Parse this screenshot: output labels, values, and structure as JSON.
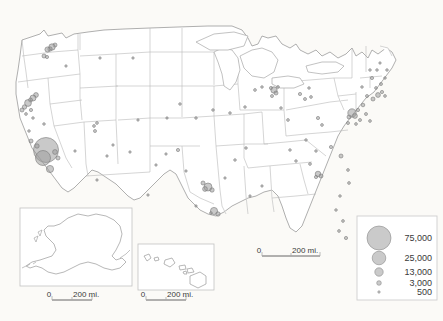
{
  "map": {
    "title": "United States proportional symbol map",
    "background_color": "#fbfaf7",
    "state_fill": "#ffffff",
    "state_stroke": "#b9b9b9",
    "bubble_fill": "#9d9d9d",
    "bubble_stroke": "#7a7a7a"
  },
  "legend": {
    "name": "proportional-symbol-legend",
    "entries": [
      {
        "value": "75,000",
        "radius": 12.0
      },
      {
        "value": "25,000",
        "radius": 6.8
      },
      {
        "value": "13,000",
        "radius": 4.2
      },
      {
        "value": "3,000",
        "radius": 2.3
      },
      {
        "value": "500",
        "radius": 1.2
      }
    ]
  },
  "scale_bars": [
    {
      "name": "main-scale-bar",
      "zero": "0",
      "distance": "200 mi."
    },
    {
      "name": "alaska-scale-bar",
      "zero": "0",
      "distance": "200 mi."
    },
    {
      "name": "hawaii-scale-bar",
      "zero": "0",
      "distance": "200 mi."
    }
  ],
  "insets": [
    {
      "name": "alaska-inset",
      "label": ""
    },
    {
      "name": "hawaii-inset",
      "label": ""
    }
  ],
  "chart_data": {
    "type": "scatter",
    "xlabel": "",
    "ylabel": "",
    "symbol_scale": "area proportional to value",
    "legend_values": [
      75000,
      25000,
      13000,
      3000,
      500
    ],
    "points": [
      {
        "x": 55.0,
        "y": 45.0,
        "r": 2.0
      },
      {
        "x": 52.0,
        "y": 47.0,
        "r": 3.2
      },
      {
        "x": 50.0,
        "y": 49.0,
        "r": 2.2
      },
      {
        "x": 47.5,
        "y": 49.5,
        "r": 2.6
      },
      {
        "x": 44.0,
        "y": 56.0,
        "r": 2.0
      },
      {
        "x": 47.0,
        "y": 57.0,
        "r": 1.6
      },
      {
        "x": 66.0,
        "y": 66.0,
        "r": 1.2
      },
      {
        "x": 100.0,
        "y": 58.0,
        "r": 1.2
      },
      {
        "x": 133.0,
        "y": 58.0,
        "r": 1.2
      },
      {
        "x": 36.0,
        "y": 95.0,
        "r": 2.4
      },
      {
        "x": 33.0,
        "y": 98.0,
        "r": 3.0
      },
      {
        "x": 30.5,
        "y": 100.0,
        "r": 2.0
      },
      {
        "x": 28.0,
        "y": 103.0,
        "r": 3.4
      },
      {
        "x": 24.5,
        "y": 107.0,
        "r": 2.2
      },
      {
        "x": 22.0,
        "y": 110.0,
        "r": 2.0
      },
      {
        "x": 31.0,
        "y": 110.0,
        "r": 1.6
      },
      {
        "x": 26.0,
        "y": 114.0,
        "r": 1.4
      },
      {
        "x": 33.0,
        "y": 118.0,
        "r": 1.3
      },
      {
        "x": 44.0,
        "y": 124.0,
        "r": 1.3
      },
      {
        "x": 29.0,
        "y": 131.0,
        "r": 1.3
      },
      {
        "x": 31.0,
        "y": 141.0,
        "r": 2.0
      },
      {
        "x": 46.0,
        "y": 150.0,
        "r": 12.5
      },
      {
        "x": 43.0,
        "y": 158.0,
        "r": 7.5
      },
      {
        "x": 55.0,
        "y": 152.0,
        "r": 2.4
      },
      {
        "x": 58.0,
        "y": 158.0,
        "r": 2.0
      },
      {
        "x": 50.0,
        "y": 169.0,
        "r": 3.6
      },
      {
        "x": 37.0,
        "y": 146.0,
        "r": 2.2
      },
      {
        "x": 75.0,
        "y": 151.0,
        "r": 1.2
      },
      {
        "x": 94.0,
        "y": 126.0,
        "r": 1.4
      },
      {
        "x": 97.0,
        "y": 123.0,
        "r": 1.4
      },
      {
        "x": 95.0,
        "y": 131.0,
        "r": 1.5
      },
      {
        "x": 107.0,
        "y": 156.0,
        "r": 1.2
      },
      {
        "x": 138.0,
        "y": 120.0,
        "r": 1.2
      },
      {
        "x": 166.0,
        "y": 154.0,
        "r": 1.2
      },
      {
        "x": 156.0,
        "y": 165.0,
        "r": 1.2
      },
      {
        "x": 178.0,
        "y": 150.0,
        "r": 1.6
      },
      {
        "x": 203.0,
        "y": 183.0,
        "r": 2.0
      },
      {
        "x": 208.0,
        "y": 187.0,
        "r": 4.0
      },
      {
        "x": 205.0,
        "y": 189.0,
        "r": 2.4
      },
      {
        "x": 212.0,
        "y": 190.0,
        "r": 2.2
      },
      {
        "x": 211.0,
        "y": 213.0,
        "r": 1.4
      },
      {
        "x": 214.0,
        "y": 211.0,
        "r": 3.6
      },
      {
        "x": 218.0,
        "y": 214.0,
        "r": 2.2
      },
      {
        "x": 196.0,
        "y": 206.0,
        "r": 1.2
      },
      {
        "x": 186.0,
        "y": 171.0,
        "r": 1.2
      },
      {
        "x": 225.0,
        "y": 178.0,
        "r": 1.2
      },
      {
        "x": 235.0,
        "y": 160.0,
        "r": 1.3
      },
      {
        "x": 246.0,
        "y": 148.0,
        "r": 1.3
      },
      {
        "x": 250.0,
        "y": 196.0,
        "r": 1.2
      },
      {
        "x": 262.0,
        "y": 186.0,
        "r": 1.2
      },
      {
        "x": 271.0,
        "y": 88.0,
        "r": 1.6
      },
      {
        "x": 274.0,
        "y": 90.0,
        "r": 3.2
      },
      {
        "x": 276.0,
        "y": 93.0,
        "r": 2.0
      },
      {
        "x": 278.0,
        "y": 87.0,
        "r": 1.4
      },
      {
        "x": 272.0,
        "y": 96.0,
        "r": 1.5
      },
      {
        "x": 281.0,
        "y": 108.0,
        "r": 1.3
      },
      {
        "x": 288.0,
        "y": 120.0,
        "r": 1.4
      },
      {
        "x": 300.0,
        "y": 94.0,
        "r": 1.6
      },
      {
        "x": 305.0,
        "y": 99.0,
        "r": 1.5
      },
      {
        "x": 311.0,
        "y": 97.0,
        "r": 1.4
      },
      {
        "x": 309.0,
        "y": 88.0,
        "r": 1.3
      },
      {
        "x": 318.0,
        "y": 118.0,
        "r": 1.6
      },
      {
        "x": 322.0,
        "y": 125.0,
        "r": 1.4
      },
      {
        "x": 306.0,
        "y": 140.0,
        "r": 1.3
      },
      {
        "x": 290.0,
        "y": 150.0,
        "r": 1.3
      },
      {
        "x": 296.0,
        "y": 161.0,
        "r": 1.3
      },
      {
        "x": 310.0,
        "y": 164.0,
        "r": 1.4
      },
      {
        "x": 316.0,
        "y": 151.0,
        "r": 1.3
      },
      {
        "x": 318.0,
        "y": 174.0,
        "r": 2.8
      },
      {
        "x": 321.0,
        "y": 176.0,
        "r": 2.0
      },
      {
        "x": 316.0,
        "y": 177.0,
        "r": 1.6
      },
      {
        "x": 331.0,
        "y": 147.0,
        "r": 1.6
      },
      {
        "x": 341.0,
        "y": 156.0,
        "r": 2.0
      },
      {
        "x": 348.0,
        "y": 170.0,
        "r": 1.4
      },
      {
        "x": 349.0,
        "y": 183.0,
        "r": 1.4
      },
      {
        "x": 340.0,
        "y": 196.0,
        "r": 1.3
      },
      {
        "x": 336.0,
        "y": 210.0,
        "r": 1.3
      },
      {
        "x": 343.0,
        "y": 221.0,
        "r": 1.4
      },
      {
        "x": 339.0,
        "y": 231.0,
        "r": 1.4
      },
      {
        "x": 346.0,
        "y": 238.0,
        "r": 1.6
      },
      {
        "x": 352.0,
        "y": 113.0,
        "r": 4.2
      },
      {
        "x": 355.0,
        "y": 116.0,
        "r": 2.4
      },
      {
        "x": 349.0,
        "y": 117.0,
        "r": 2.0
      },
      {
        "x": 358.0,
        "y": 110.0,
        "r": 1.6
      },
      {
        "x": 363.0,
        "y": 105.0,
        "r": 1.8
      },
      {
        "x": 360.0,
        "y": 120.0,
        "r": 1.5
      },
      {
        "x": 366.0,
        "y": 114.0,
        "r": 1.5
      },
      {
        "x": 370.0,
        "y": 121.0,
        "r": 1.4
      },
      {
        "x": 356.0,
        "y": 124.0,
        "r": 1.4
      },
      {
        "x": 348.0,
        "y": 123.0,
        "r": 1.5
      },
      {
        "x": 367.0,
        "y": 96.0,
        "r": 1.5
      },
      {
        "x": 373.0,
        "y": 99.0,
        "r": 2.0
      },
      {
        "x": 378.0,
        "y": 95.0,
        "r": 2.4
      },
      {
        "x": 382.0,
        "y": 92.0,
        "r": 1.6
      },
      {
        "x": 385.0,
        "y": 96.0,
        "r": 1.4
      },
      {
        "x": 376.0,
        "y": 88.0,
        "r": 1.4
      },
      {
        "x": 381.0,
        "y": 84.0,
        "r": 1.5
      },
      {
        "x": 372.0,
        "y": 78.0,
        "r": 1.6
      },
      {
        "x": 370.0,
        "y": 70.0,
        "r": 1.3
      },
      {
        "x": 377.0,
        "y": 70.0,
        "r": 1.3
      },
      {
        "x": 380.0,
        "y": 63.0,
        "r": 1.2
      },
      {
        "x": 362.0,
        "y": 87.0,
        "r": 1.3
      },
      {
        "x": 385.0,
        "y": 78.0,
        "r": 1.3
      },
      {
        "x": 387.0,
        "y": 70.0,
        "r": 1.3
      },
      {
        "x": 255.0,
        "y": 90.0,
        "r": 1.4
      },
      {
        "x": 262.0,
        "y": 87.0,
        "r": 1.3
      },
      {
        "x": 245.0,
        "y": 107.0,
        "r": 1.3
      },
      {
        "x": 230.0,
        "y": 113.0,
        "r": 1.3
      },
      {
        "x": 213.0,
        "y": 110.0,
        "r": 1.3
      },
      {
        "x": 196.0,
        "y": 118.0,
        "r": 1.3
      },
      {
        "x": 180.0,
        "y": 104.0,
        "r": 1.3
      },
      {
        "x": 167.0,
        "y": 118.0,
        "r": 1.2
      },
      {
        "x": 130.0,
        "y": 152.0,
        "r": 1.2
      },
      {
        "x": 113.0,
        "y": 145.0,
        "r": 1.2
      },
      {
        "x": 97.0,
        "y": 180.0,
        "r": 1.2
      },
      {
        "x": 148.0,
        "y": 195.0,
        "r": 1.2
      },
      {
        "x": 93.0,
        "y": 254.0,
        "r": 1.8
      },
      {
        "x": 96.0,
        "y": 256.0,
        "r": 2.2
      },
      {
        "x": 90.0,
        "y": 257.0,
        "r": 1.4
      },
      {
        "x": 189.0,
        "y": 275.0,
        "r": 2.4
      },
      {
        "x": 183.0,
        "y": 272.0,
        "r": 1.4
      },
      {
        "x": 152.0,
        "y": 262.0,
        "r": 1.4
      },
      {
        "x": 156.0,
        "y": 259.0,
        "r": 1.2
      }
    ]
  }
}
